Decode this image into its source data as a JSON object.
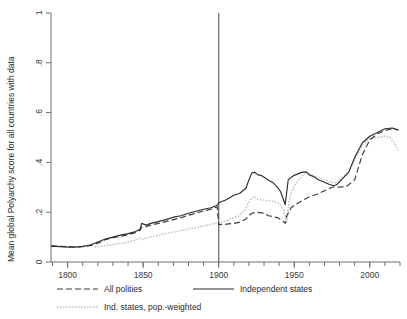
{
  "chart_data": {
    "type": "line",
    "title": "",
    "xlabel": "",
    "ylabel": "Mean global Polyarchy score for all countries with data",
    "xlim": [
      1789,
      2020
    ],
    "ylim": [
      0,
      1
    ],
    "grid": false,
    "legend_position": "bottom",
    "x_ticks": [
      1800,
      1850,
      1900,
      1950,
      2000
    ],
    "x_tick_labels": [
      "1800",
      "1850",
      "1900",
      "1950",
      "2000"
    ],
    "x_minor_tick_step": 10,
    "y_ticks": [
      0,
      0.2,
      0.4,
      0.6,
      0.8,
      1
    ],
    "y_tick_labels": [
      "0",
      ".2",
      ".4",
      ".6",
      ".8",
      "1"
    ],
    "annotations": [
      {
        "name": "reference-line-1900",
        "type": "vline",
        "x": 1900
      }
    ],
    "series": [
      {
        "name": "All polities",
        "style": "dashed",
        "color": "#3a3a3a",
        "x": [
          1789,
          1795,
          1800,
          1805,
          1810,
          1815,
          1820,
          1825,
          1830,
          1835,
          1840,
          1845,
          1848,
          1849,
          1852,
          1855,
          1860,
          1865,
          1870,
          1875,
          1880,
          1885,
          1890,
          1895,
          1899,
          1900,
          1905,
          1910,
          1914,
          1918,
          1920,
          1922,
          1925,
          1930,
          1933,
          1936,
          1939,
          1942,
          1944,
          1945,
          1948,
          1950,
          1955,
          1960,
          1965,
          1970,
          1975,
          1978,
          1980,
          1985,
          1990,
          1995,
          2000,
          2005,
          2010,
          2015,
          2019
        ],
        "values": [
          0.065,
          0.063,
          0.062,
          0.06,
          0.062,
          0.066,
          0.075,
          0.09,
          0.098,
          0.103,
          0.11,
          0.118,
          0.128,
          0.14,
          0.142,
          0.148,
          0.155,
          0.162,
          0.17,
          0.178,
          0.188,
          0.196,
          0.205,
          0.212,
          0.222,
          0.15,
          0.152,
          0.155,
          0.16,
          0.172,
          0.186,
          0.196,
          0.2,
          0.196,
          0.186,
          0.182,
          0.178,
          0.168,
          0.155,
          0.185,
          0.218,
          0.228,
          0.245,
          0.262,
          0.272,
          0.286,
          0.3,
          0.302,
          0.3,
          0.305,
          0.33,
          0.43,
          0.49,
          0.515,
          0.528,
          0.535,
          0.53
        ]
      },
      {
        "name": "Independent states",
        "style": "solid",
        "color": "#2d2d2d",
        "x": [
          1789,
          1795,
          1800,
          1805,
          1810,
          1815,
          1820,
          1825,
          1830,
          1835,
          1840,
          1845,
          1848,
          1849,
          1852,
          1855,
          1860,
          1865,
          1870,
          1875,
          1880,
          1885,
          1890,
          1895,
          1899,
          1900,
          1905,
          1910,
          1914,
          1918,
          1920,
          1922,
          1924,
          1926,
          1928,
          1930,
          1933,
          1936,
          1939,
          1941,
          1943,
          1944,
          1946,
          1948,
          1950,
          1955,
          1958,
          1960,
          1963,
          1966,
          1970,
          1973,
          1976,
          1978,
          1982,
          1986,
          1990,
          1995,
          2000,
          2005,
          2010,
          2015,
          2019
        ],
        "values": [
          0.064,
          0.062,
          0.06,
          0.06,
          0.063,
          0.068,
          0.08,
          0.092,
          0.1,
          0.108,
          0.114,
          0.122,
          0.132,
          0.155,
          0.148,
          0.155,
          0.162,
          0.17,
          0.18,
          0.186,
          0.196,
          0.204,
          0.212,
          0.218,
          0.228,
          0.238,
          0.25,
          0.268,
          0.276,
          0.296,
          0.33,
          0.358,
          0.36,
          0.35,
          0.348,
          0.34,
          0.328,
          0.318,
          0.3,
          0.282,
          0.248,
          0.23,
          0.33,
          0.34,
          0.348,
          0.36,
          0.362,
          0.35,
          0.342,
          0.33,
          0.32,
          0.312,
          0.306,
          0.31,
          0.335,
          0.36,
          0.42,
          0.478,
          0.505,
          0.52,
          0.535,
          0.538,
          0.53
        ]
      },
      {
        "name": "Ind. states, pop.-weighted",
        "style": "dotted",
        "color": "#c2c2c2",
        "x": [
          1818,
          1825,
          1830,
          1835,
          1840,
          1845,
          1848,
          1850,
          1855,
          1860,
          1865,
          1870,
          1875,
          1880,
          1885,
          1890,
          1895,
          1900,
          1905,
          1910,
          1914,
          1918,
          1920,
          1922,
          1924,
          1926,
          1928,
          1930,
          1933,
          1936,
          1939,
          1941,
          1943,
          1945,
          1947,
          1950,
          1953,
          1956,
          1960,
          1963,
          1966,
          1970,
          1974,
          1978,
          1982,
          1986,
          1990,
          1995,
          2000,
          2005,
          2010,
          2013,
          2016,
          2019
        ],
        "values": [
          0.06,
          0.066,
          0.07,
          0.074,
          0.08,
          0.088,
          0.096,
          0.092,
          0.1,
          0.108,
          0.114,
          0.12,
          0.126,
          0.132,
          0.138,
          0.145,
          0.152,
          0.158,
          0.166,
          0.178,
          0.186,
          0.215,
          0.24,
          0.258,
          0.262,
          0.252,
          0.25,
          0.248,
          0.246,
          0.244,
          0.238,
          0.228,
          0.208,
          0.16,
          0.26,
          0.305,
          0.33,
          0.352,
          0.358,
          0.345,
          0.34,
          0.33,
          0.32,
          0.318,
          0.34,
          0.362,
          0.41,
          0.468,
          0.496,
          0.5,
          0.505,
          0.502,
          0.48,
          0.448
        ]
      }
    ]
  },
  "legend": {
    "items": [
      {
        "label": "All polities",
        "style": "dashed"
      },
      {
        "label": "Independent states",
        "style": "solid"
      },
      {
        "label": "Ind. states, pop.-weighted",
        "style": "dotted"
      }
    ]
  },
  "axes": {
    "y_title": "Mean global Polyarchy score for all countries with data"
  }
}
